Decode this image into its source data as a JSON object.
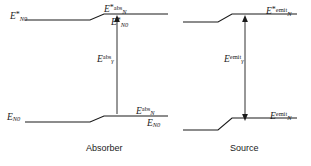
{
  "figure": {
    "captions": [
      {
        "id": "absorber",
        "text": "Absorber",
        "x": 86,
        "y": 146
      },
      {
        "id": "source",
        "text": "Source",
        "x": 230,
        "y": 146
      }
    ],
    "columns": [
      "Absorber",
      "Source"
    ],
    "levels": [
      {
        "id": "absorber-excited-ground",
        "panel": "Absorber",
        "row": "upper",
        "label": "E*N0",
        "E": "E",
        "star": "*",
        "sub": "N0",
        "sup": "",
        "x": 10,
        "y": 11
      },
      {
        "id": "absorber-excited-abs",
        "panel": "Absorber",
        "row": "upper",
        "label": "E*abs_N",
        "E": "E",
        "star": "*",
        "sub": "N",
        "sup": "abs",
        "x": 104,
        "y": 6
      },
      {
        "id": "absorber-excited-ground-right",
        "panel": "Absorber",
        "row": "upper",
        "label": "E*N0",
        "E": "E",
        "star": "*",
        "sub": "N0",
        "sup": "",
        "x": 114,
        "y": 18
      },
      {
        "id": "source-excited-emit",
        "panel": "Source",
        "row": "upper",
        "label": "E*emit_N",
        "E": "E",
        "star": "*",
        "sub": "N",
        "sup": "emit",
        "x": 268,
        "y": 9
      },
      {
        "id": "absorber-ground-N0",
        "panel": "Absorber",
        "row": "lower",
        "label": "EN0",
        "E": "E",
        "star": "",
        "sub": "N0",
        "sup": "",
        "x": 7,
        "y": 113
      },
      {
        "id": "absorber-ground-abs",
        "panel": "Absorber",
        "row": "lower",
        "label": "Eabs_N",
        "E": "E",
        "star": "",
        "sub": "N",
        "sup": "abs",
        "x": 138,
        "y": 108
      },
      {
        "id": "absorber-ground-N0-right",
        "panel": "Absorber",
        "row": "lower",
        "label": "EN0",
        "E": "E",
        "star": "",
        "sub": "N0",
        "sup": "",
        "x": 150,
        "y": 120
      },
      {
        "id": "source-ground-emit",
        "panel": "Source",
        "row": "lower",
        "label": "Eemit_N",
        "E": "E",
        "star": "",
        "sub": "N",
        "sup": "emit",
        "x": 272,
        "y": 113
      }
    ],
    "transitions": [
      {
        "id": "absorption-photon",
        "label": "Eabs_gamma",
        "E": "E",
        "sub": "γ",
        "sup": "abs",
        "arrow": "up",
        "x": 99,
        "y": 56
      },
      {
        "id": "emission-photon",
        "label": "Eemit_gamma",
        "E": "E",
        "sub": "γ",
        "sup": "emit",
        "arrow": "double",
        "x": 238,
        "y": 56
      }
    ],
    "colors": {
      "line": "#1a1a1a",
      "arrow": "#1a1a1a",
      "text": "#1a1a1a",
      "background": "#ffffff"
    }
  }
}
